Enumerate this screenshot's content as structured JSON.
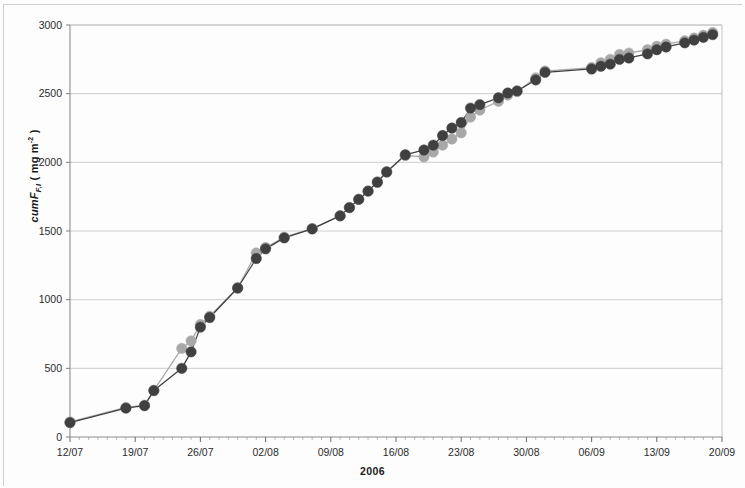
{
  "figure": {
    "background": "#fdfdfd",
    "plot_area": {
      "x": 70,
      "y": 25,
      "width": 652,
      "height": 412
    }
  },
  "axis": {
    "y_title_main": "cumF",
    "y_title_sub": "F,I",
    "y_title_unit_open": " ( mg m",
    "y_title_unit_sup": "-2",
    "y_title_unit_close": " )",
    "x_title": "2006"
  },
  "chart_data": {
    "type": "line",
    "title": "",
    "xlabel": "2006",
    "ylabel": "cumF_F,I ( mg m^-2 )",
    "ylim": [
      0,
      3000
    ],
    "yticks": [
      0,
      500,
      1000,
      1500,
      2000,
      2500,
      3000
    ],
    "ytick_labels": [
      "0",
      "500",
      "1000",
      "1500",
      "2000",
      "2500",
      "3000"
    ],
    "xlim": [
      "12/07",
      "20/09"
    ],
    "xticks": [
      "12/07",
      "19/07",
      "26/07",
      "02/08",
      "09/08",
      "16/08",
      "23/08",
      "30/08",
      "06/09",
      "13/09",
      "20/09"
    ],
    "xtick_labels": [
      "12/07",
      "19/07",
      "26/07",
      "02/08",
      "09/08",
      "16/08",
      "23/08",
      "30/08",
      "06/09",
      "13/09",
      "20/09"
    ],
    "x_day_range": [
      0,
      70
    ],
    "grid": "horizontal",
    "legend": "none",
    "marker": "circle",
    "colors": {
      "series_dark": "#404040",
      "series_light": "#a8a8a8",
      "grid": "#c8c8c8",
      "frame": "#9a9a9a"
    },
    "series": [
      {
        "name": "Series dark",
        "color": "#404040",
        "marker_size": 5.2,
        "points": [
          {
            "day": 0,
            "value": 105
          },
          {
            "day": 6,
            "value": 210
          },
          {
            "day": 8,
            "value": 228
          },
          {
            "day": 9,
            "value": 338
          },
          {
            "day": 12,
            "value": 500
          },
          {
            "day": 13,
            "value": 620
          },
          {
            "day": 14,
            "value": 800
          },
          {
            "day": 15,
            "value": 870
          },
          {
            "day": 18,
            "value": 1085
          },
          {
            "day": 20,
            "value": 1300
          },
          {
            "day": 21,
            "value": 1370
          },
          {
            "day": 23,
            "value": 1450
          },
          {
            "day": 26,
            "value": 1515
          },
          {
            "day": 29,
            "value": 1610
          },
          {
            "day": 30,
            "value": 1670
          },
          {
            "day": 31,
            "value": 1730
          },
          {
            "day": 32,
            "value": 1790
          },
          {
            "day": 33,
            "value": 1855
          },
          {
            "day": 34,
            "value": 1930
          },
          {
            "day": 36,
            "value": 2055
          },
          {
            "day": 38,
            "value": 2090
          },
          {
            "day": 39,
            "value": 2125
          },
          {
            "day": 40,
            "value": 2195
          },
          {
            "day": 41,
            "value": 2250
          },
          {
            "day": 42,
            "value": 2290
          },
          {
            "day": 43,
            "value": 2395
          },
          {
            "day": 44,
            "value": 2420
          },
          {
            "day": 46,
            "value": 2470
          },
          {
            "day": 47,
            "value": 2505
          },
          {
            "day": 48,
            "value": 2520
          },
          {
            "day": 50,
            "value": 2600
          },
          {
            "day": 51,
            "value": 2655
          },
          {
            "day": 56,
            "value": 2680
          },
          {
            "day": 57,
            "value": 2700
          },
          {
            "day": 58,
            "value": 2715
          },
          {
            "day": 59,
            "value": 2750
          },
          {
            "day": 60,
            "value": 2760
          },
          {
            "day": 62,
            "value": 2790
          },
          {
            "day": 63,
            "value": 2820
          },
          {
            "day": 64,
            "value": 2840
          },
          {
            "day": 66,
            "value": 2870
          },
          {
            "day": 67,
            "value": 2890
          },
          {
            "day": 68,
            "value": 2910
          },
          {
            "day": 69,
            "value": 2930
          }
        ]
      },
      {
        "name": "Series light",
        "color": "#a8a8a8",
        "marker_size": 5.2,
        "points": [
          {
            "day": 0,
            "value": 110
          },
          {
            "day": 6,
            "value": 215
          },
          {
            "day": 8,
            "value": 232
          },
          {
            "day": 9,
            "value": 340
          },
          {
            "day": 12,
            "value": 645
          },
          {
            "day": 13,
            "value": 700
          },
          {
            "day": 14,
            "value": 820
          },
          {
            "day": 15,
            "value": 880
          },
          {
            "day": 18,
            "value": 1085
          },
          {
            "day": 20,
            "value": 1340
          },
          {
            "day": 21,
            "value": 1380
          },
          {
            "day": 23,
            "value": 1455
          },
          {
            "day": 26,
            "value": 1518
          },
          {
            "day": 29,
            "value": 1612
          },
          {
            "day": 30,
            "value": 1672
          },
          {
            "day": 31,
            "value": 1732
          },
          {
            "day": 32,
            "value": 1792
          },
          {
            "day": 33,
            "value": 1858
          },
          {
            "day": 34,
            "value": 1932
          },
          {
            "day": 36,
            "value": 2050
          },
          {
            "day": 38,
            "value": 2040
          },
          {
            "day": 39,
            "value": 2075
          },
          {
            "day": 40,
            "value": 2125
          },
          {
            "day": 41,
            "value": 2170
          },
          {
            "day": 42,
            "value": 2215
          },
          {
            "day": 43,
            "value": 2330
          },
          {
            "day": 44,
            "value": 2380
          },
          {
            "day": 46,
            "value": 2445
          },
          {
            "day": 47,
            "value": 2490
          },
          {
            "day": 48,
            "value": 2515
          },
          {
            "day": 50,
            "value": 2615
          },
          {
            "day": 51,
            "value": 2665
          },
          {
            "day": 56,
            "value": 2690
          },
          {
            "day": 57,
            "value": 2725
          },
          {
            "day": 58,
            "value": 2750
          },
          {
            "day": 59,
            "value": 2785
          },
          {
            "day": 60,
            "value": 2795
          },
          {
            "day": 62,
            "value": 2820
          },
          {
            "day": 63,
            "value": 2845
          },
          {
            "day": 64,
            "value": 2860
          },
          {
            "day": 66,
            "value": 2885
          },
          {
            "day": 67,
            "value": 2905
          },
          {
            "day": 68,
            "value": 2925
          },
          {
            "day": 69,
            "value": 2945
          }
        ]
      }
    ]
  }
}
